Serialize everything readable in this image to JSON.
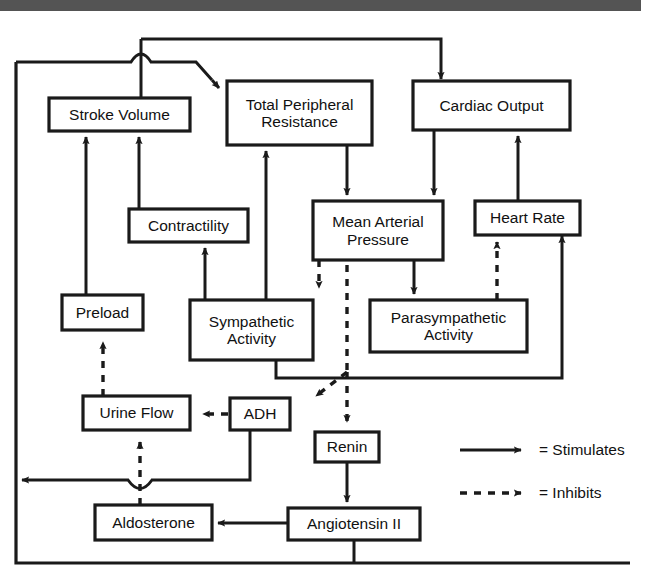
{
  "figure": {
    "stroke_color": "#1a1a1a",
    "header_bar_color": "#545454",
    "background_color": "#ffffff"
  },
  "nodes": [
    {
      "id": "stroke_volume",
      "label": "Stroke Volume",
      "x": 49,
      "y": 98,
      "w": 141,
      "h": 33
    },
    {
      "id": "total_peripheral",
      "label": "Total Peripheral\nResistance",
      "x": 227,
      "y": 81,
      "w": 145,
      "h": 64
    },
    {
      "id": "cardiac_output",
      "label": "Cardiac Output",
      "x": 413,
      "y": 81,
      "w": 157,
      "h": 49
    },
    {
      "id": "contractility",
      "label": "Contractility",
      "x": 129,
      "y": 209,
      "w": 119,
      "h": 33
    },
    {
      "id": "mean_arterial",
      "label": "Mean Arterial\nPressure",
      "x": 313,
      "y": 201,
      "w": 130,
      "h": 59
    },
    {
      "id": "heart_rate",
      "label": "Heart Rate",
      "x": 475,
      "y": 201,
      "w": 105,
      "h": 34
    },
    {
      "id": "preload",
      "label": "Preload",
      "x": 62,
      "y": 295,
      "w": 81,
      "h": 35
    },
    {
      "id": "sympathetic",
      "label": "Sympathetic\nActivity",
      "x": 190,
      "y": 300,
      "w": 123,
      "h": 60
    },
    {
      "id": "parasympathetic",
      "label": "Parasympathetic\nActivity",
      "x": 370,
      "y": 300,
      "w": 157,
      "h": 52
    },
    {
      "id": "urine_flow",
      "label": "Urine Flow",
      "x": 83,
      "y": 396,
      "w": 107,
      "h": 34
    },
    {
      "id": "adh",
      "label": "ADH",
      "x": 230,
      "y": 398,
      "w": 60,
      "h": 32
    },
    {
      "id": "renin",
      "label": "Renin",
      "x": 315,
      "y": 432,
      "w": 64,
      "h": 30
    },
    {
      "id": "aldosterone",
      "label": "Aldosterone",
      "x": 95,
      "y": 505,
      "w": 117,
      "h": 35
    },
    {
      "id": "angiotensin_ii",
      "label": "Angiotensin II",
      "x": 288,
      "y": 508,
      "w": 132,
      "h": 32
    }
  ],
  "legend": {
    "items": [
      {
        "id": "stimulates",
        "style": "solid",
        "label": "= Stimulates",
        "line_y": 450,
        "text_x": 539,
        "text_y": 450
      },
      {
        "id": "inhibits",
        "style": "dashed",
        "label": "= Inhibits",
        "line_y": 493,
        "text_x": 539,
        "text_y": 493
      }
    ],
    "line_x1": 460,
    "line_x2": 528
  },
  "edges": [
    {
      "id": "sv-to-top",
      "from": "stroke_volume",
      "to": "total_peripheral",
      "type": "stimulates"
    },
    {
      "id": "sv-to-cardiac",
      "from": "stroke_volume",
      "to": "cardiac_output",
      "type": "stimulates"
    },
    {
      "id": "contractility-to-sv",
      "from": "contractility",
      "to": "stroke_volume",
      "type": "stimulates"
    },
    {
      "id": "preload-to-sv",
      "from": "preload",
      "to": "stroke_volume",
      "type": "stimulates"
    },
    {
      "id": "tpr-to-map",
      "from": "total_peripheral",
      "to": "mean_arterial",
      "type": "stimulates"
    },
    {
      "id": "co-to-map",
      "from": "cardiac_output",
      "to": "mean_arterial",
      "type": "stimulates"
    },
    {
      "id": "sympathetic-to-tpr",
      "from": "sympathetic",
      "to": "total_peripheral",
      "type": "stimulates"
    },
    {
      "id": "sympathetic-to-contr",
      "from": "sympathetic",
      "to": "contractility",
      "type": "stimulates"
    },
    {
      "id": "sympathetic-to-hr",
      "from": "sympathetic",
      "to": "heart_rate",
      "type": "stimulates"
    },
    {
      "id": "map-to-sympathetic",
      "from": "mean_arterial",
      "to": "sympathetic",
      "type": "inhibits"
    },
    {
      "id": "map-to-parasym",
      "from": "mean_arterial",
      "to": "parasympathetic",
      "type": "stimulates"
    },
    {
      "id": "parasym-to-hr",
      "from": "parasympathetic",
      "to": "heart_rate",
      "type": "inhibits"
    },
    {
      "id": "hr-to-co",
      "from": "heart_rate",
      "to": "cardiac_output",
      "type": "stimulates"
    },
    {
      "id": "map-to-adh",
      "from": "mean_arterial",
      "to": "adh",
      "type": "inhibits"
    },
    {
      "id": "map-to-renin",
      "from": "mean_arterial",
      "to": "renin",
      "type": "inhibits"
    },
    {
      "id": "adh-to-urine",
      "from": "adh",
      "to": "urine_flow",
      "type": "inhibits"
    },
    {
      "id": "adh-to-blood-volume",
      "from": "adh",
      "to": "preload",
      "type": "stimulates"
    },
    {
      "id": "aldo-to-urine",
      "from": "aldosterone",
      "to": "urine_flow",
      "type": "inhibits"
    },
    {
      "id": "urine-to-preload",
      "from": "urine_flow",
      "to": "preload",
      "type": "inhibits"
    },
    {
      "id": "renin-to-ang",
      "from": "renin",
      "to": "angiotensin_ii",
      "type": "stimulates"
    },
    {
      "id": "ang-to-aldo",
      "from": "angiotensin_ii",
      "to": "aldosterone",
      "type": "stimulates"
    },
    {
      "id": "ang-to-tpr",
      "from": "angiotensin_ii",
      "to": "total_peripheral",
      "type": "stimulates"
    }
  ]
}
